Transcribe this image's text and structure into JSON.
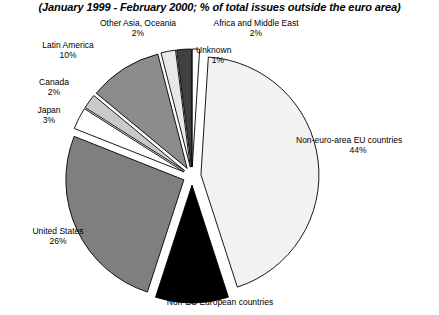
{
  "chart_data": {
    "type": "pie",
    "title": "(January 1999 - February 2000; % of total issues outside the euro area)",
    "subtitle": "",
    "xlabel": "",
    "ylabel": "",
    "legend_position": "none",
    "grid": false,
    "exploded": true,
    "value_suffix": "%",
    "categories": [
      "Unknown",
      "Non-euro-area EU countries",
      "Non-EU European countries",
      "United States",
      "Japan",
      "Canada",
      "Latin America",
      "Other Asia, Oceania",
      "Africa and Middle East"
    ],
    "values": [
      1,
      44,
      10,
      26,
      3,
      2,
      10,
      2,
      2
    ],
    "slices": [
      {
        "name": "Unknown",
        "label": "Unknown",
        "value": 1,
        "value_text": "1%",
        "fill": "#ffffff",
        "stroke": "#000000",
        "label_visible": true
      },
      {
        "name": "Non-euro-area EU countries",
        "label": "Non-euro-area EU countries",
        "value": 44,
        "value_text": "44%",
        "fill": "#f2f2f2",
        "stroke": "#000000",
        "label_visible": true
      },
      {
        "name": "Non-EU European countries",
        "label": "Non-EU European countries",
        "value": 10,
        "value_text": "",
        "fill": "#000000",
        "stroke": "#000000",
        "label_visible": true
      },
      {
        "name": "United States",
        "label": "United States",
        "value": 26,
        "value_text": "26%",
        "fill": "#7f7f7f",
        "stroke": "#000000",
        "label_visible": true
      },
      {
        "name": "Japan",
        "label": "Japan",
        "value": 3,
        "value_text": "3%",
        "fill": "#ffffff",
        "stroke": "#000000",
        "label_visible": true
      },
      {
        "name": "Canada",
        "label": "Canada",
        "value": 2,
        "value_text": "2%",
        "fill": "#c9c9c9",
        "stroke": "#000000",
        "label_visible": true
      },
      {
        "name": "Latin America",
        "label": "Latin America",
        "value": 10,
        "value_text": "10%",
        "fill": "#8c8c8c",
        "stroke": "#000000",
        "label_visible": true
      },
      {
        "name": "Other Asia, Oceania",
        "label": "Other Asia, Oceania",
        "value": 2,
        "value_text": "2%",
        "fill": "#e8e8e8",
        "stroke": "#000000",
        "label_visible": true
      },
      {
        "name": "Africa and Middle East",
        "label": "Africa and Middle East",
        "value": 2,
        "value_text": "2%",
        "fill": "#404040",
        "stroke": "#000000",
        "label_visible": true
      }
    ]
  },
  "labels": {
    "other_asia": {
      "name": "Other Asia, Oceania",
      "pct": "2%"
    },
    "africa": {
      "name": "Africa and Middle East",
      "pct": "2%"
    },
    "unknown": {
      "name": "Unknown",
      "pct": "1%"
    },
    "latin_america": {
      "name": "Latin America",
      "pct": "10%"
    },
    "canada": {
      "name": "Canada",
      "pct": "2%"
    },
    "japan": {
      "name": "Japan",
      "pct": "3%"
    },
    "united_states": {
      "name": "United States",
      "pct": "26%"
    },
    "non_euro_eu": {
      "name": "Non-euro-area EU countries",
      "pct": "44%"
    },
    "non_eu_european": {
      "name": "Non-EU European countries",
      "pct": ""
    }
  },
  "colors": {
    "background": "#ffffff",
    "outline": "#000000",
    "text": "#000000"
  }
}
